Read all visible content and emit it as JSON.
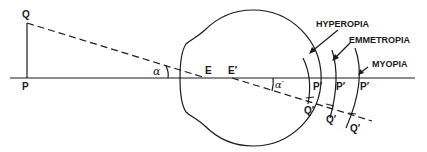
{
  "diagram": {
    "type": "eye-optics-refractive-error",
    "labels": {
      "object_top": "Q",
      "object_base": "P",
      "angle_object": "α",
      "nodal_point_1": "E",
      "nodal_point_2": "E′",
      "angle_image": "α′",
      "hyperopia": "HYPEROPIA",
      "emmetropia": "EMMETROPIA",
      "myopia": "MYOPIA",
      "image_base_hyperopia": "P′",
      "image_base_emmetropia": "P′",
      "image_base_myopia": "P′",
      "image_top_hyperopia": "Q′",
      "image_top_emmetropia": "Q′",
      "image_top_myopia": "Q′"
    },
    "colors": {
      "line": "#1a1a1a",
      "background": "#ffffff"
    }
  }
}
